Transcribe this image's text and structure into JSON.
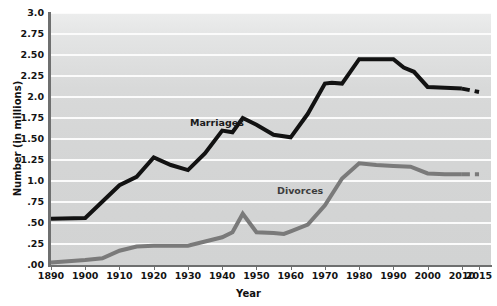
{
  "chart_data": {
    "type": "line",
    "title": "",
    "xlabel": "Year",
    "ylabel": "Number (in millions)",
    "xlim": [
      1890,
      2015
    ],
    "ylim": [
      0.0,
      3.0
    ],
    "grid": true,
    "legend_position": "inline-labels",
    "x_tick_labels": [
      "1890",
      "1900",
      "1910",
      "1920",
      "1930",
      "1940",
      "1950",
      "1960",
      "1970",
      "1980",
      "1990",
      "2000",
      "2010",
      "2015"
    ],
    "y_tick_labels": [
      ".00",
      ".25",
      ".50",
      ".75",
      "1.0",
      "1.25",
      "1.50",
      "1.75",
      "2.0",
      "2.25",
      "2.50",
      "2.75",
      "3.0"
    ],
    "y_tick_values": [
      0.0,
      0.25,
      0.5,
      0.75,
      1.0,
      1.25,
      1.5,
      1.75,
      2.0,
      2.25,
      2.5,
      2.75,
      3.0
    ],
    "series": [
      {
        "name": "Marriages",
        "color": "#121212",
        "label_x": 1945,
        "label_y": 1.78,
        "solid": {
          "x": [
            1890,
            1900,
            1910,
            1915,
            1920,
            1925,
            1930,
            1935,
            1940,
            1943,
            1946,
            1950,
            1955,
            1960,
            1965,
            1970,
            1972,
            1975,
            1980,
            1985,
            1990,
            1993,
            1996,
            2000,
            2005,
            2010
          ],
          "y": [
            0.55,
            0.56,
            0.95,
            1.05,
            1.28,
            1.19,
            1.13,
            1.33,
            1.6,
            1.58,
            1.75,
            1.67,
            1.55,
            1.52,
            1.8,
            2.16,
            2.17,
            2.16,
            2.45,
            2.45,
            2.45,
            2.35,
            2.3,
            2.12,
            2.11,
            2.1
          ]
        },
        "dashed": {
          "x": [
            2010,
            2015
          ],
          "y": [
            2.1,
            2.06
          ]
        }
      },
      {
        "name": "Divorces",
        "color": "#7a7a7a",
        "label_x": 1967,
        "label_y": 0.92,
        "solid": {
          "x": [
            1890,
            1900,
            1905,
            1910,
            1915,
            1920,
            1925,
            1930,
            1935,
            1940,
            1943,
            1946,
            1950,
            1955,
            1958,
            1960,
            1965,
            1970,
            1975,
            1980,
            1985,
            1990,
            1995,
            2000,
            2005,
            2010
          ],
          "y": [
            0.03,
            0.06,
            0.08,
            0.17,
            0.22,
            0.23,
            0.23,
            0.23,
            0.28,
            0.33,
            0.39,
            0.61,
            0.39,
            0.38,
            0.37,
            0.4,
            0.48,
            0.71,
            1.03,
            1.21,
            1.19,
            1.18,
            1.17,
            1.09,
            1.08,
            1.08
          ]
        },
        "dashed": {
          "x": [
            2010,
            2015
          ],
          "y": [
            1.08,
            1.08
          ]
        }
      }
    ]
  },
  "axis": {
    "x_title": "Year",
    "y_title": "Number (in millions)"
  },
  "colors": {
    "marriages_line": "#121212",
    "divorces_line": "#7a7a7a",
    "plot_background": "#d6d7d7",
    "gridline": "#fbfbfb",
    "axis": "#6e6f6f"
  }
}
